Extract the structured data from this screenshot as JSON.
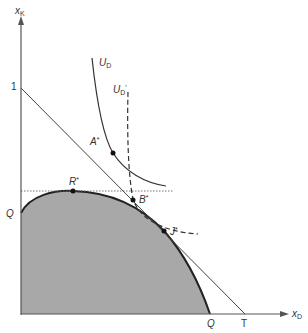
{
  "diagram": {
    "type": "economics-production-possibility-frontier",
    "axes": {
      "y_label": "x",
      "y_label_sub": "K",
      "x_label": "x",
      "x_label_sub": "D",
      "y_intercept_one": "1",
      "x_intercept_T": "T"
    },
    "frontier": {
      "y_intercept_label": "Q",
      "x_intercept_label": "Q",
      "fill_color": "#a8a8a8",
      "stroke_color": "#222222"
    },
    "indifference_curves": [
      {
        "name": "U",
        "sub": "D",
        "prime": "",
        "style": "solid"
      },
      {
        "name": "U",
        "sub": "D",
        "prime": "′",
        "style": "dashed"
      }
    ],
    "points": [
      {
        "label": "A",
        "sup": "*"
      },
      {
        "label": "R",
        "sup": "*"
      },
      {
        "label": "B",
        "sup": "*"
      },
      {
        "label": "J",
        "sup": "*"
      }
    ],
    "colors": {
      "axis": "#555555",
      "line": "#444444",
      "dotted_line": "#666666"
    }
  }
}
